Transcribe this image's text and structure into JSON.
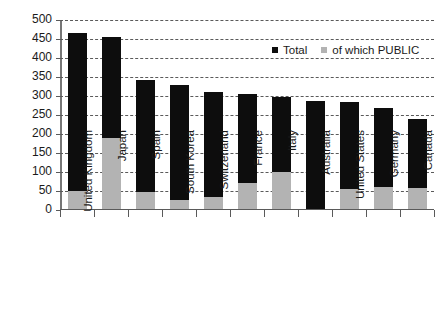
{
  "chart_data": {
    "type": "bar",
    "subtype": "stacked-overlay",
    "title": "",
    "xlabel": "",
    "ylabel": "Percentage of GDP",
    "ylim": [
      0,
      500
    ],
    "ytick_step": 50,
    "yticks": [
      0,
      50,
      100,
      150,
      200,
      250,
      300,
      350,
      400,
      450,
      500
    ],
    "ytick_labels": [
      "0",
      "50",
      "100",
      "150",
      "200",
      "250",
      "300",
      "350",
      "400",
      "450",
      "500"
    ],
    "grid": true,
    "grid_style": "dashed-horizontal",
    "legend_position": "top-right",
    "categories": [
      "United Kingdom",
      "Japan",
      "Spain",
      "South Korea",
      "Switzerland",
      "France",
      "Italy",
      "Australia",
      "United States",
      "Germany",
      "Canada"
    ],
    "series": [
      {
        "name": "Total",
        "color": "#0d0d0d",
        "values": [
          467,
          455,
          341,
          328,
          311,
          305,
          298,
          288,
          283,
          268,
          240
        ]
      },
      {
        "name": "of which PUBLIC",
        "color": "#b3b3b3",
        "values": [
          50,
          190,
          47,
          27,
          35,
          70,
          100,
          0,
          55,
          60,
          57
        ]
      }
    ]
  },
  "legend": {
    "entries": [
      {
        "label": "Total",
        "marker": "square-black"
      },
      {
        "label": "of which PUBLIC",
        "marker": "square-gray"
      }
    ]
  },
  "colors": {
    "total": "#0d0d0d",
    "public": "#b3b3b3",
    "axis": "#5a5a5a",
    "background": "#ffffff"
  }
}
